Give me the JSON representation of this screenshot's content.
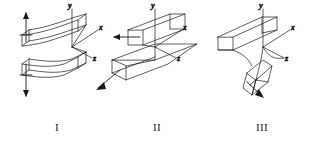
{
  "diagram": {
    "background_color": "#ffffff",
    "line_color": "#1a1a1a",
    "figures": [
      {
        "id": "I",
        "label": "I",
        "name": "mode-i-opening",
        "description": "Opening mode: cracked block pulled apart, upper half deflects up and lower half deflects down along the y axis",
        "axes": {
          "x": "x",
          "y": "y",
          "z": "z"
        },
        "load_arrows": [
          "up",
          "down"
        ],
        "arrow_direction": "vertical-opposed"
      },
      {
        "id": "II",
        "label": "II",
        "name": "mode-ii-sliding",
        "description": "In-plane shear mode: upper half slides forward relative to the lower half along the x axis",
        "axes": {
          "x": "x",
          "y": "y",
          "z": "z"
        },
        "load_arrows": [
          "forward-left",
          "backward-left"
        ],
        "arrow_direction": "in-plane-shear"
      },
      {
        "id": "III",
        "label": "III",
        "name": "mode-iii-tearing",
        "description": "Out-of-plane tearing mode: lower half twists out of plane along the z axis",
        "axes": {
          "x": "x",
          "y": "y",
          "z": "z"
        },
        "load_arrows": [
          "out-of-plane"
        ],
        "arrow_direction": "anti-plane-shear"
      }
    ]
  }
}
